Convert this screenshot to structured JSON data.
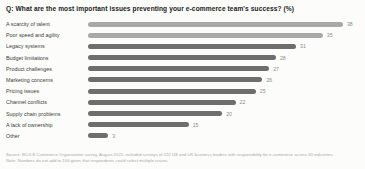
{
  "chart_data": {
    "type": "bar",
    "orientation": "horizontal",
    "title": "Q: What are the most important issues preventing your e-commerce team's success? (%)",
    "categories": [
      "A scarcity of talent",
      "Poor speed and agility",
      "Legacy systems",
      "Budget limitations",
      "Product challenges",
      "Marketing concerns",
      "Pricing issues",
      "Channel conflicts",
      "Supply chain problems",
      "A lack of ownership",
      "Other"
    ],
    "values": [
      38,
      35,
      31,
      28,
      27,
      26,
      25,
      22,
      20,
      15,
      3
    ],
    "highlighted_rows": [
      0,
      1
    ],
    "highlight_color": "#a9a9a9",
    "base_color": "#6e6e6e",
    "value_label_color": "#8d8d8d",
    "xlim": [
      0,
      40
    ],
    "grid": false,
    "legend": "none",
    "value_labels_shown": true
  },
  "footer": {
    "source_line": "Source: BCG E-Commerce Organization survey, August 2021; included surveys of 222 US and UK business leaders with responsibility for e-commerce across 30 industries.",
    "note_line": "Note: Numbers do not add to 100 given that respondents could select multiple issues."
  }
}
